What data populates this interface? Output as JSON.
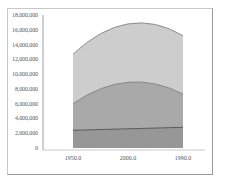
{
  "chart_data": {
    "type": "area",
    "title": "",
    "xlabel": "",
    "ylabel": "",
    "categories": [
      "1950.0",
      "2000.0",
      "1990.0"
    ],
    "x_tick_labels": [
      "1950.0",
      "2000.0",
      "1990.0"
    ],
    "y_tick_labels": [
      "0",
      "2,000,000",
      "4,000,000",
      "6,000,000",
      "8,000,000",
      "10,000,000",
      "12,000,000",
      "14,000,000",
      "16,000,000",
      "18,000,000"
    ],
    "ylim": [
      0,
      18000000
    ],
    "grid": false,
    "legend": "none",
    "stacked": true,
    "series": [
      {
        "name": "series-1",
        "values": [
          2400000,
          2600000,
          2800000
        ],
        "color": "#8f8f8f"
      },
      {
        "name": "series-2",
        "values": [
          3600000,
          6300000,
          4500000
        ],
        "color": "#a8a8a8"
      },
      {
        "name": "series-3",
        "values": [
          6700000,
          7900000,
          7900000
        ],
        "color": "#cfcfcf"
      }
    ],
    "cumulative_top": [
      12700000,
      16800000,
      15200000
    ]
  },
  "colors": {
    "layer_top": "#cdcdcd",
    "layer_middle": "#a9a9a9",
    "layer_bottom": "#979797",
    "line": "#555555",
    "frame": "#9a9a9a",
    "axis": "#888888"
  }
}
